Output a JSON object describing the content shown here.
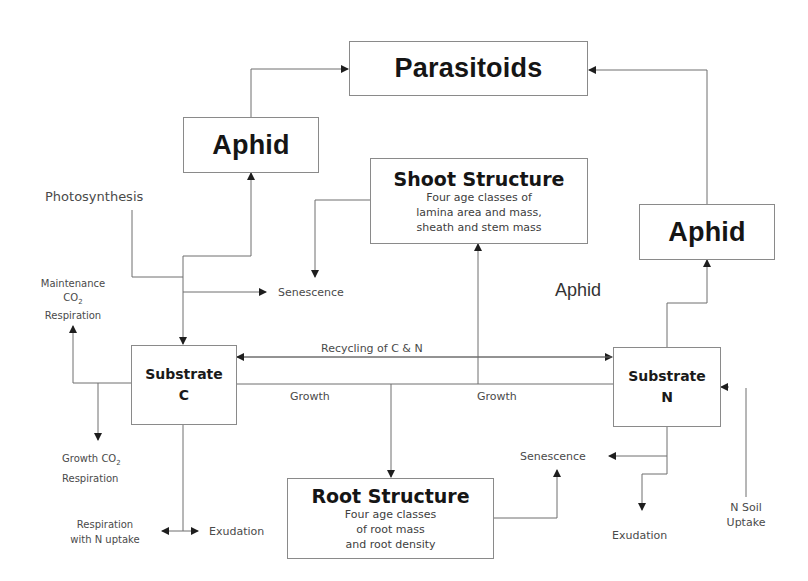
{
  "diagram": {
    "type": "plant-aphid-parasitoid model flow diagram",
    "colors": {
      "line": "#6e6e6e",
      "box_border": "#8a8a8a",
      "text": "#2a2a2a"
    }
  },
  "boxes": {
    "parasitoids": {
      "title": "Parasitoids"
    },
    "aphid_left": {
      "title": "Aphid"
    },
    "aphid_right": {
      "title": "Aphid"
    },
    "shoot_structure": {
      "title": "Shoot Structure",
      "desc": [
        "Four age classes of",
        "lamina area and mass,",
        "sheath and stem mass"
      ]
    },
    "substrate_c": {
      "title_line1": "Substrate",
      "title_line2": "C"
    },
    "substrate_n": {
      "title_line1": "Substrate",
      "title_line2": "N"
    },
    "root_structure": {
      "title": "Root Structure",
      "desc": [
        "Four age classes",
        "of root mass",
        "and root density"
      ]
    }
  },
  "labels": {
    "photosynthesis": "Photosynthesis",
    "senescence_shoot": "Senescence",
    "maintenance": {
      "line1": "Maintenance",
      "line2_base": "CO",
      "line2_sub": "2",
      "line3": "Respiration"
    },
    "aphid_floating": "Aphid",
    "recycling": "Recycling of C & N",
    "growth_left": "Growth",
    "growth_right": "Growth",
    "growth_co2": {
      "line1_base": "Growth CO",
      "line1_sub": "2",
      "line2": "Respiration"
    },
    "respiration_n_uptake": {
      "line1": "Respiration",
      "line2": "with N uptake"
    },
    "exudation_c": "Exudation",
    "senescence_root": "Senescence",
    "exudation_n": "Exudation",
    "n_soil_uptake": {
      "line1": "N Soil",
      "line2": "Uptake"
    }
  }
}
